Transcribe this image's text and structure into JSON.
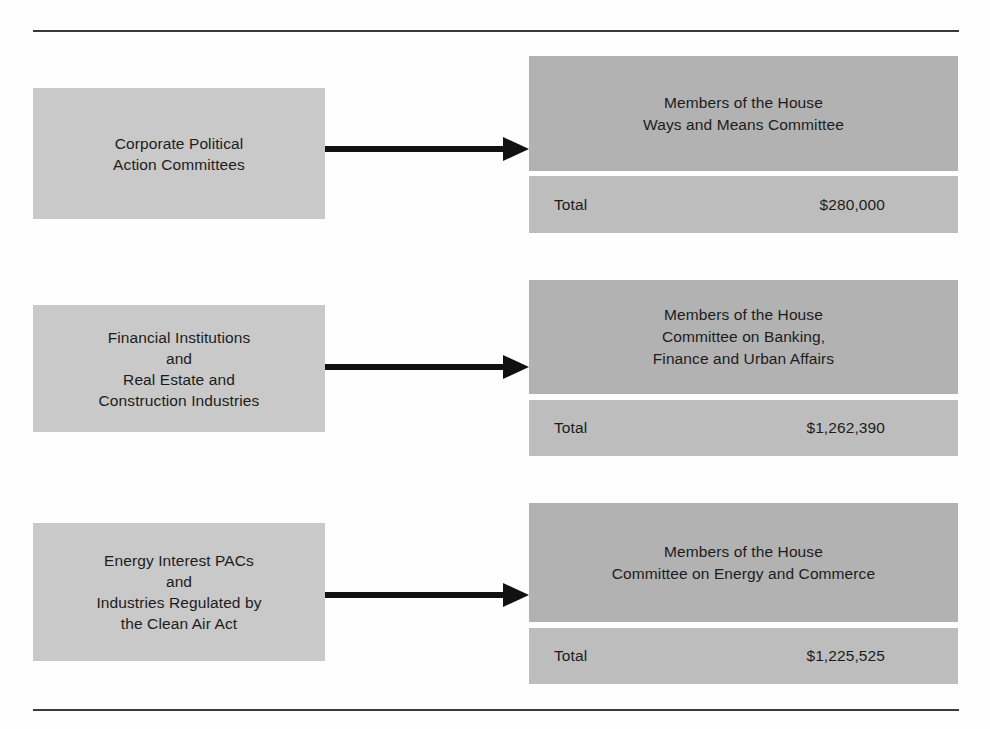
{
  "figure": {
    "kind": "flow-diagram",
    "rule_color": "#3a3a3a",
    "source_box_color": "#c9c9c9",
    "target_header_color": "#b2b2b2",
    "target_total_color": "#bdbdbd",
    "arrow_color": "#111111"
  },
  "rows": [
    {
      "source": "Corporate Political\nAction Committees",
      "target": "Members of the House\nWays and Means Committee",
      "total_label": "Total",
      "total_amount": "$280,000",
      "arrow_icon": "right-arrow-icon"
    },
    {
      "source": "Financial Institutions\nand\nReal Estate and\nConstruction Industries",
      "target": "Members of the House\nCommittee on Banking,\nFinance and Urban Affairs",
      "total_label": "Total",
      "total_amount": "$1,262,390",
      "arrow_icon": "right-arrow-icon"
    },
    {
      "source": "Energy Interest PACs\nand\nIndustries Regulated by\nthe Clean Air Act",
      "target": "Members of the House\nCommittee on Energy and Commerce",
      "total_label": "Total",
      "total_amount": "$1,225,525",
      "arrow_icon": "right-arrow-icon"
    }
  ]
}
